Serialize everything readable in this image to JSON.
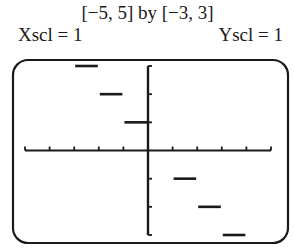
{
  "header": {
    "window": "[−5, 5] by [−3, 3]",
    "xscl": "Xscl = 1",
    "yscl": "Yscl = 1"
  },
  "chart_data": {
    "type": "line",
    "title": "[−5, 5] by [−3, 3]",
    "xlabel": "",
    "ylabel": "",
    "xlim": [
      -5,
      5
    ],
    "ylim": [
      -3,
      3
    ],
    "xscl": 1,
    "yscl": 1,
    "grid": false,
    "function": "step function y = -int(x)",
    "segments": [
      {
        "x0": -3,
        "x1": -2,
        "y": 3
      },
      {
        "x0": -2,
        "x1": -1,
        "y": 2
      },
      {
        "x0": -1,
        "x1": 0,
        "y": 1
      },
      {
        "x0": 0,
        "x1": 1,
        "y": 0
      },
      {
        "x0": 1,
        "x1": 2,
        "y": -1
      },
      {
        "x0": 2,
        "x1": 3,
        "y": -2
      },
      {
        "x0": 3,
        "x1": 4,
        "y": -3
      }
    ]
  },
  "style": {
    "ink": "#1a1a1a",
    "background": "#ffffff"
  }
}
